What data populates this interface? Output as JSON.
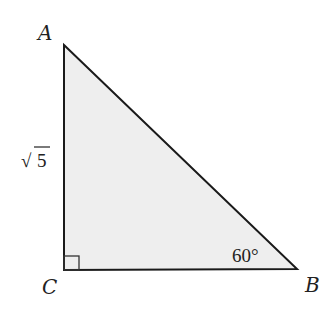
{
  "diagram": {
    "type": "right-triangle",
    "colors": {
      "fill": "#eeeeee",
      "stroke": "#1a1a1a",
      "text": "#222222"
    },
    "vertices": {
      "A": {
        "label": "A",
        "x": 64,
        "y": 45
      },
      "B": {
        "label": "B",
        "x": 297,
        "y": 269
      },
      "C": {
        "label": "C",
        "x": 64,
        "y": 270
      }
    },
    "side_AC": {
      "label": "√5",
      "radicand": "5",
      "radical": "√"
    },
    "angle_B": {
      "label": "60°"
    },
    "right_angle_at": "C"
  }
}
